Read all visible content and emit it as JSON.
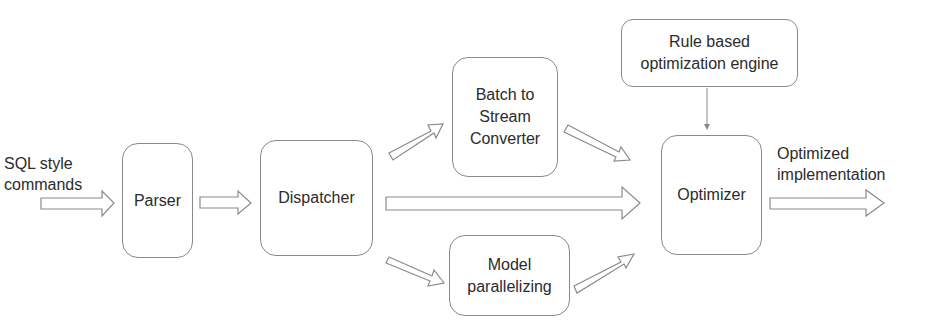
{
  "diagram": {
    "input_label": [
      "SQL style",
      "commands"
    ],
    "output_label": [
      "Optimized",
      "implementation"
    ],
    "nodes": {
      "parser": "Parser",
      "dispatcher": "Dispatcher",
      "batch_to_stream": [
        "Batch to",
        "Stream",
        "Converter"
      ],
      "model_parallelizing": [
        "Model",
        "parallelizing"
      ],
      "rule_engine": [
        "Rule based",
        "optimization engine"
      ],
      "optimizer": "Optimizer"
    },
    "edges": [
      {
        "from": "input",
        "to": "parser"
      },
      {
        "from": "parser",
        "to": "dispatcher"
      },
      {
        "from": "dispatcher",
        "to": "batch_to_stream"
      },
      {
        "from": "dispatcher",
        "to": "optimizer"
      },
      {
        "from": "dispatcher",
        "to": "model_parallelizing"
      },
      {
        "from": "batch_to_stream",
        "to": "optimizer"
      },
      {
        "from": "model_parallelizing",
        "to": "optimizer"
      },
      {
        "from": "rule_engine",
        "to": "optimizer"
      },
      {
        "from": "optimizer",
        "to": "output"
      }
    ],
    "colors": {
      "stroke": "#8a8a8a",
      "text": "#2b2b2b",
      "background": "#ffffff"
    }
  }
}
